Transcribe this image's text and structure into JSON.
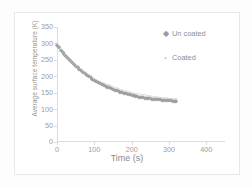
{
  "chart_data": {
    "type": "scatter",
    "title": "",
    "xlabel": "Time (s)",
    "ylabel": "Average surface temperature (K)",
    "xlim": [
      0,
      450
    ],
    "ylim": [
      0,
      350
    ],
    "xticks": [
      0,
      100,
      200,
      300,
      400
    ],
    "yticks": [
      0,
      50,
      100,
      150,
      200,
      250,
      300,
      350
    ],
    "grid": false,
    "legend_position": "top-right",
    "series": [
      {
        "name": "Un coated",
        "marker": "diamond",
        "color": "#9e9e9e",
        "x": [
          0,
          5,
          10,
          15,
          20,
          25,
          30,
          35,
          40,
          45,
          50,
          55,
          60,
          65,
          70,
          75,
          80,
          85,
          90,
          95,
          100,
          105,
          110,
          115,
          120,
          125,
          130,
          135,
          140,
          145,
          150,
          155,
          160,
          165,
          170,
          175,
          180,
          185,
          190,
          195,
          200,
          205,
          210,
          215,
          220,
          225,
          230,
          235,
          240,
          245,
          250,
          255,
          260,
          265,
          270,
          275,
          280,
          285,
          290,
          295,
          300,
          305,
          310,
          315,
          320
        ],
        "y": [
          296,
          288,
          281,
          274,
          267,
          261,
          255,
          249,
          243,
          238,
          232,
          227,
          222,
          218,
          213,
          209,
          205,
          201,
          197,
          193,
          190,
          186,
          183,
          180,
          177,
          174,
          171,
          168,
          166,
          163,
          161,
          159,
          157,
          155,
          153,
          151,
          149,
          148,
          146,
          145,
          143,
          142,
          141,
          139,
          138,
          137,
          136,
          135,
          134,
          134,
          133,
          132,
          131,
          131,
          130,
          130,
          129,
          129,
          128,
          128,
          127,
          127,
          126,
          126,
          125
        ]
      },
      {
        "name": "Coated",
        "marker": "cross",
        "color": "#c0c0c0",
        "x": [
          0,
          5,
          10,
          15,
          20,
          25,
          30,
          35,
          40,
          45,
          50,
          55,
          60,
          65,
          70,
          75,
          80,
          85,
          90,
          95,
          100,
          105,
          110,
          115,
          120,
          125,
          130,
          135,
          140,
          145,
          150,
          155,
          160,
          165,
          170,
          175,
          180,
          185,
          190,
          195,
          200,
          205,
          210,
          215,
          220,
          225,
          230,
          235,
          240,
          245,
          250,
          255,
          260,
          265,
          270,
          275,
          280,
          285,
          290,
          295,
          300,
          305,
          310,
          315,
          320
        ],
        "y": [
          294,
          286,
          279,
          272,
          266,
          259,
          253,
          248,
          242,
          237,
          232,
          227,
          222,
          218,
          214,
          210,
          206,
          203,
          199,
          196,
          193,
          190,
          187,
          184,
          181,
          179,
          176,
          174,
          172,
          169,
          167,
          165,
          163,
          161,
          159,
          158,
          156,
          154,
          153,
          151,
          150,
          149,
          147,
          146,
          145,
          144,
          143,
          142,
          141,
          140,
          139,
          138,
          137,
          137,
          136,
          135,
          135,
          134,
          133,
          133,
          132,
          131,
          131,
          130,
          130
        ]
      }
    ]
  },
  "legend": {
    "items": [
      {
        "label": "Un coated",
        "marker_glyph": "◆",
        "marker_name": "diamond-marker-icon"
      },
      {
        "label": "Coated",
        "marker_glyph": "×",
        "marker_name": "cross-marker-icon"
      }
    ]
  }
}
